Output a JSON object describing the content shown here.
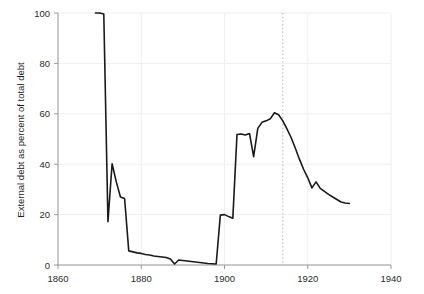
{
  "chart_data": {
    "type": "line",
    "title": "",
    "subtitle": "",
    "xlabel": "",
    "ylabel": "External debt as percent of total debt",
    "xlim": [
      1860,
      1940
    ],
    "ylim": [
      0,
      100
    ],
    "grid": true,
    "legend_position": "none",
    "xticks": [
      1860,
      1880,
      1900,
      1920,
      1940
    ],
    "xtick_labels": [
      "1860",
      "1880",
      "1900",
      "1920",
      "1940"
    ],
    "yticks": [
      0,
      20,
      40,
      60,
      80,
      100
    ],
    "ytick_labels": [
      "0",
      "20",
      "40",
      "60",
      "80",
      "100"
    ],
    "line_color": "#1a1a1a",
    "line_width": 1.6,
    "grid_color": "#f0eeee",
    "axis_color": "#9a9a9a",
    "annotations": [
      {
        "name": "wwi-start-marker",
        "type": "vline",
        "x": 1914,
        "style": "dotted",
        "color": "#b9b9b9",
        "label": ""
      }
    ],
    "series": [
      {
        "name": "External debt as percent of total debt",
        "x": [
          1869,
          1870,
          1871,
          1872,
          1873,
          1874,
          1875,
          1876,
          1877,
          1878,
          1879,
          1880,
          1881,
          1882,
          1883,
          1884,
          1885,
          1886,
          1887,
          1888,
          1889,
          1890,
          1891,
          1892,
          1893,
          1894,
          1895,
          1896,
          1897,
          1898,
          1899,
          1900,
          1901,
          1902,
          1903,
          1904,
          1905,
          1906,
          1907,
          1908,
          1909,
          1910,
          1911,
          1912,
          1913,
          1914,
          1915,
          1916,
          1917,
          1918,
          1919,
          1920,
          1921,
          1922,
          1923,
          1924,
          1925,
          1926,
          1927,
          1928,
          1929,
          1930
        ],
        "y": [
          100,
          100,
          99.6,
          17.2,
          40.2,
          33.0,
          27.0,
          26.4,
          5.6,
          5.2,
          4.8,
          4.6,
          4.2,
          4.0,
          3.6,
          3.4,
          3.2,
          3.0,
          2.4,
          0.4,
          2.0,
          1.8,
          1.6,
          1.4,
          1.2,
          1.0,
          0.8,
          0.6,
          0.5,
          0.4,
          19.8,
          20.0,
          19.2,
          18.6,
          51.8,
          52.0,
          51.6,
          52.2,
          43.0,
          54.2,
          56.6,
          57.2,
          58.0,
          60.4,
          59.6,
          57.2,
          54.0,
          50.6,
          46.4,
          42.0,
          38.0,
          34.6,
          30.6,
          33.0,
          30.4,
          29.2,
          28.0,
          27.0,
          26.0,
          25.0,
          24.6,
          24.4
        ]
      }
    ]
  },
  "yaxis": {
    "title": "External debt as percent of total debt"
  }
}
